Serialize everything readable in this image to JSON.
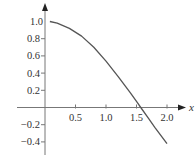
{
  "chart_data": {
    "type": "line",
    "title": "",
    "xlabel": "x",
    "ylabel": "",
    "xlim": [
      -0.45,
      2.2
    ],
    "ylim": [
      -0.55,
      1.2
    ],
    "grid": false,
    "legend": null,
    "x_ticks": [
      0.5,
      1.0,
      1.5,
      2.0
    ],
    "x_tick_labels": [
      "0.5",
      "1.0",
      "1.5",
      "2.0"
    ],
    "y_ticks": [
      1.0,
      0.8,
      0.6,
      0.4,
      0.2,
      -0.2,
      -0.4
    ],
    "y_tick_labels": [
      "1.0",
      "0.8",
      "0.6",
      "0.4",
      "0.2",
      "−0.2",
      "−0.4"
    ],
    "series": [
      {
        "name": "curve",
        "color": "#555555",
        "x": [
          0.08,
          0.2,
          0.4,
          0.6,
          0.8,
          1.0,
          1.2,
          1.4,
          1.5,
          1.57,
          1.7,
          1.8,
          2.0
        ],
        "y": [
          1.0,
          0.98,
          0.92,
          0.83,
          0.7,
          0.54,
          0.36,
          0.17,
          0.07,
          0.0,
          -0.13,
          -0.23,
          -0.42
        ]
      }
    ]
  },
  "axis_color": "#777777"
}
